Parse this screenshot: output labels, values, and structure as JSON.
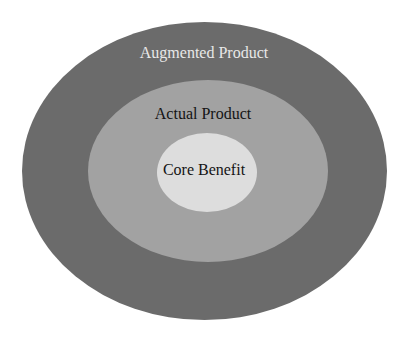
{
  "diagram": {
    "type": "concentric-ellipses",
    "rings": [
      {
        "id": "augmented",
        "label": "Augmented Product",
        "fill": "#6b6b6b",
        "text_color": "#e8e8e8",
        "cx": 204.5,
        "cy": 171,
        "rx": 182.5,
        "ry": 149,
        "label_x": 204,
        "label_y": 58
      },
      {
        "id": "actual",
        "label": "Actual Product",
        "fill": "#a2a2a2",
        "text_color": "#141414",
        "cx": 208,
        "cy": 171,
        "rx": 120,
        "ry": 91,
        "label_x": 203,
        "label_y": 119
      },
      {
        "id": "core",
        "label": "Core Benefit",
        "fill": "#dddddd",
        "text_color": "#141414",
        "cx": 207,
        "cy": 172.5,
        "rx": 50,
        "ry": 39.5,
        "label_x": 204,
        "label_y": 175
      }
    ]
  }
}
